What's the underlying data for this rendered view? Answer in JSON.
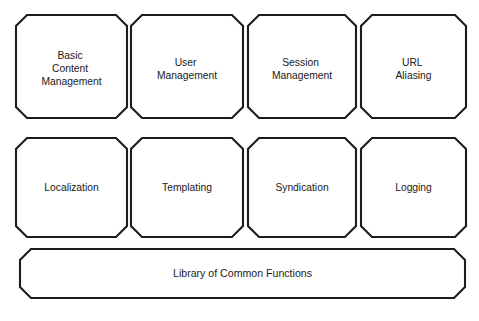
{
  "diagram": {
    "background_color": "#ffffff",
    "stroke_color": "#1c1c1c",
    "fill_color": "#ffffff",
    "text_color": "#1a1a1a",
    "shape_style": "chamfered-rectangle",
    "rows": [
      {
        "row_name": "modules-row-1",
        "nodes": [
          {
            "id": "basic-content-management",
            "label": "Basic Content Management",
            "lines": [
              "Basic",
              "Content",
              "Management"
            ]
          },
          {
            "id": "user-management",
            "label": "User Management",
            "lines": [
              "User",
              "Management"
            ]
          },
          {
            "id": "session-management",
            "label": "Session Management",
            "lines": [
              "Session",
              "Management"
            ]
          },
          {
            "id": "url-aliasing",
            "label": "URL Aliasing",
            "lines": [
              "URL",
              "Aliasing"
            ]
          }
        ]
      },
      {
        "row_name": "modules-row-2",
        "nodes": [
          {
            "id": "localization",
            "label": "Localization",
            "lines": [
              "Localization"
            ]
          },
          {
            "id": "templating",
            "label": "Templating",
            "lines": [
              "Templating"
            ]
          },
          {
            "id": "syndication",
            "label": "Syndication",
            "lines": [
              "Syndication"
            ]
          },
          {
            "id": "logging",
            "label": "Logging",
            "lines": [
              "Logging"
            ]
          }
        ]
      }
    ],
    "base": {
      "id": "library-of-common-functions",
      "label": "Library of Common Functions",
      "lines": [
        "Library of Common Functions"
      ]
    }
  }
}
